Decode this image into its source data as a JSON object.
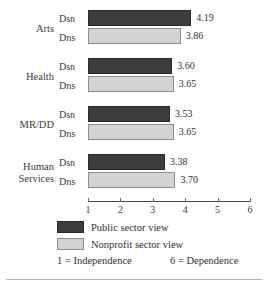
{
  "chart_data": {
    "type": "bar",
    "orientation": "horizontal",
    "title": "",
    "xlabel": "",
    "ylabel": "",
    "xlim": [
      1,
      6
    ],
    "xticks": [
      "1",
      "2",
      "3",
      "4",
      "5",
      "6"
    ],
    "grid": false,
    "legend_position": "bottom",
    "categories": [
      "Arts",
      "Health",
      "MR/DD",
      "Human Services"
    ],
    "series": [
      {
        "name": "Public sector view",
        "code": "Dsn",
        "color": "#3d3d3d",
        "values": [
          4.19,
          3.6,
          3.53,
          3.38
        ],
        "labels": [
          "4.19",
          "3.60",
          "3.53",
          "3.38"
        ]
      },
      {
        "name": "Nonprofit sector view",
        "code": "Dns",
        "color": "#d3d3d3",
        "values": [
          3.86,
          3.65,
          3.65,
          3.7
        ],
        "labels": [
          "3.86",
          "3.65",
          "3.65",
          "3.70"
        ]
      }
    ],
    "annotations": {
      "scale_min": "1 = Independence",
      "scale_max": "6 = Dependence"
    }
  },
  "groups": [
    {
      "category_lines": [
        "Arts"
      ],
      "top_code": "Dsn",
      "bottom_code": "Dns",
      "top_label": "4.19",
      "bottom_label": "3.86"
    },
    {
      "category_lines": [
        "Health"
      ],
      "top_code": "Dsn",
      "bottom_code": "Dns",
      "top_label": "3.60",
      "bottom_label": "3.65"
    },
    {
      "category_lines": [
        "MR/DD"
      ],
      "top_code": "Dsn",
      "bottom_code": "Dns",
      "top_label": "3.53",
      "bottom_label": "3.65"
    },
    {
      "category_lines": [
        "Human",
        "Services"
      ],
      "top_code": "Dsn",
      "bottom_code": "Dns",
      "top_label": "3.38",
      "bottom_label": "3.70"
    }
  ],
  "axis": {
    "ticks": [
      "1",
      "2",
      "3",
      "4",
      "5",
      "6"
    ]
  },
  "legend": {
    "items": [
      {
        "label": "Public sector view",
        "color": "#3d3d3d"
      },
      {
        "label": "Nonprofit sector view",
        "color": "#d3d3d3"
      }
    ]
  },
  "footnote": {
    "left": "1 = Independence",
    "right": "6 = Dependence"
  }
}
